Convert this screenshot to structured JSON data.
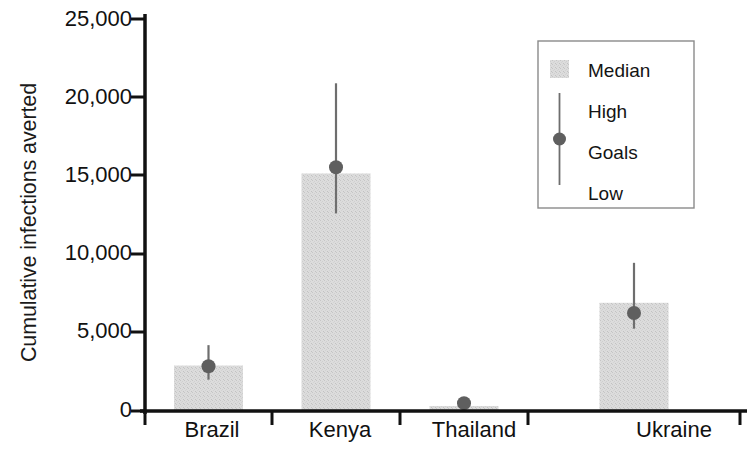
{
  "chart_data": {
    "type": "bar",
    "title": "",
    "xlabel": "",
    "ylabel": "Cumulative infections averted",
    "categories": [
      "Brazil",
      "Kenya",
      "Thailand",
      "Ukraine"
    ],
    "ylim": [
      0,
      25000
    ],
    "yticks": [
      0,
      5000,
      10000,
      15000,
      20000,
      25000
    ],
    "ytick_labels": [
      "0",
      "5,000",
      "10,000",
      "15,000",
      "20,000",
      "25,000"
    ],
    "grid": false,
    "legend_position": "top-right",
    "legend_entries": [
      {
        "label": "Median",
        "marker": "filled-square",
        "color": "#d9d9d9"
      },
      {
        "label": "High",
        "marker": "line-top",
        "color": "#6e6e6e"
      },
      {
        "label": "Goals",
        "marker": "filled-circle",
        "color": "#5f5f5f"
      },
      {
        "label": "Low",
        "marker": "line-bottom",
        "color": "#6e6e6e"
      }
    ],
    "series": [
      {
        "name": "Median",
        "values": [
          2900,
          15150,
          320,
          6900
        ]
      },
      {
        "name": "Goals",
        "values": [
          2850,
          15550,
          500,
          6250
        ]
      },
      {
        "name": "High",
        "values": [
          4200,
          20900,
          500,
          9450
        ]
      },
      {
        "name": "Low",
        "values": [
          2000,
          12600,
          500,
          5250
        ]
      }
    ]
  },
  "axis": {
    "ytitle": "Cumulative infections averted",
    "ytick_labels": [
      "25,000",
      "20,000",
      "15,000",
      "10,000",
      "5,000",
      "0"
    ],
    "xtick_labels": [
      "Brazil",
      "Kenya",
      "Thailand",
      "Ukraine"
    ]
  },
  "legend": {
    "items": [
      "Median",
      "High",
      "Goals",
      "Low"
    ]
  },
  "colors": {
    "bar_fill": "#d9d9d9",
    "bar_texture": "#c3c3c3",
    "marker": "#5f5f5f",
    "error_line": "#6e6e6e",
    "axis": "#111111",
    "legend_border": "#888888"
  }
}
